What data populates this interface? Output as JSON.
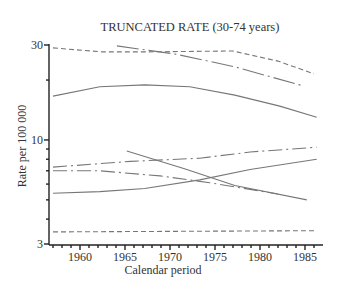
{
  "chart_data": {
    "type": "line",
    "title": "TRUNCATED RATE (30-74 years)",
    "xlabel": "Calendar period",
    "ylabel": "Rate per 100 000",
    "yscale": "log",
    "xlim": [
      1956.6,
      1986.9
    ],
    "ylim": [
      3,
      30
    ],
    "x_ticks": [
      1960,
      1965,
      1970,
      1975,
      1980,
      1985
    ],
    "x_tick_labels": [
      "1960",
      "1965",
      "1970",
      "1975",
      "1980",
      "1985"
    ],
    "y_ticks": [
      3,
      10,
      30
    ],
    "y_tick_labels": [
      "3",
      "10",
      "30"
    ],
    "grid": false,
    "legend": null,
    "series": [
      {
        "name": "series-1",
        "style": "dashed",
        "x": [
          1957,
          1962.5,
          1967,
          1977,
          1982,
          1986
        ],
        "values": [
          29.0,
          27.7,
          27.7,
          28.0,
          24.9,
          21.5
        ]
      },
      {
        "name": "series-2",
        "style": "long-dash-dot",
        "x": [
          1964.1,
          1970.6,
          1977.2,
          1984.8
        ],
        "values": [
          29.7,
          27.0,
          23.3,
          18.7
        ]
      },
      {
        "name": "series-3",
        "style": "solid",
        "x": [
          1957,
          1962.2,
          1967.2,
          1972.2,
          1977.2,
          1982.2,
          1986.3
        ],
        "values": [
          16.6,
          18.5,
          18.9,
          18.5,
          16.8,
          14.8,
          13.0
        ]
      },
      {
        "name": "series-4",
        "style": "dash-dot",
        "x": [
          1957,
          1965.6,
          1973.3,
          1978.9,
          1986.3
        ],
        "values": [
          7.3,
          7.8,
          8.1,
          8.7,
          9.2
        ]
      },
      {
        "name": "series-5",
        "style": "dash-dot",
        "x": [
          1957,
          1962.2,
          1968.9,
          1974.4,
          1982
        ],
        "values": [
          7.0,
          7.0,
          6.6,
          6.1,
          5.35
        ]
      },
      {
        "name": "series-6",
        "style": "solid",
        "x": [
          1957,
          1962.2,
          1967.2,
          1973.3,
          1978.9,
          1986.3
        ],
        "values": [
          5.4,
          5.5,
          5.7,
          6.3,
          7.1,
          8.0
        ]
      },
      {
        "name": "series-7",
        "style": "solid",
        "x": [
          1965.2,
          1971.7,
          1977.2,
          1985.2
        ],
        "values": [
          8.8,
          7.15,
          5.9,
          5.0
        ]
      },
      {
        "name": "series-8",
        "style": "dashed",
        "x": [
          1957,
          1986.3
        ],
        "values": [
          3.45,
          3.5
        ]
      }
    ]
  }
}
